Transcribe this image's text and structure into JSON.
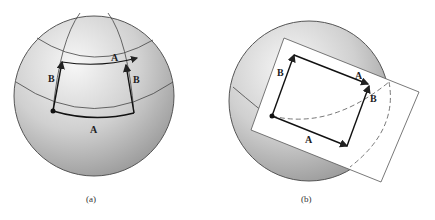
{
  "figures": [
    {
      "id": "a",
      "caption": "(a)",
      "description": "Vector transported around a closed loop on sphere surface",
      "labels": {
        "bottom_A": "A",
        "top_A": "A",
        "left_B": "B",
        "right_B": "B"
      }
    },
    {
      "id": "b",
      "caption": "(b)",
      "description": "Same loop on flat tangent plane",
      "labels": {
        "bottom_A": "A",
        "top_A": "A",
        "left_B": "B",
        "right_B": "B"
      }
    }
  ],
  "colors": {
    "sphere_light": "#f2f2f2",
    "sphere_dark": "#9a9a9a",
    "line": "#222222",
    "plane": "#ffffff"
  }
}
